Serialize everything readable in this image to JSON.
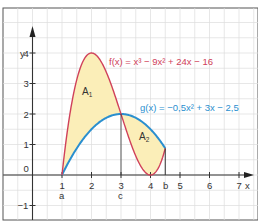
{
  "chart_data": {
    "type": "line",
    "title": "",
    "xlabel": "x",
    "ylabel": "y",
    "xlim": [
      -1,
      7.4
    ],
    "ylim": [
      -1.45,
      4.5
    ],
    "grid": true,
    "grid_step": 0.5,
    "x_ticks": [
      1,
      2,
      3,
      4,
      5,
      6,
      7
    ],
    "x_tick_labels": [
      "1",
      "2",
      "3",
      "4",
      "5",
      "6",
      "7"
    ],
    "y_ticks": [
      -1,
      0,
      1,
      2,
      3,
      4
    ],
    "y_tick_labels": [
      "-1",
      "0",
      "1",
      "2",
      "3",
      "4"
    ],
    "series": [
      {
        "name": "f(x) = x³ − 9x² + 24x − 16",
        "label": "f(x) = x³ − 9x² + 24x − 16",
        "coefficients": [
          1,
          -9,
          24,
          -16
        ],
        "domain": [
          1,
          4.5
        ],
        "color": "#d0415a"
      },
      {
        "name": "g(x) = −0,5x² + 3x − 2,5",
        "label": "g(x) = −0,5x² + 3x − 2,5",
        "coefficients": [
          -0.5,
          3,
          -2.5
        ],
        "domain": [
          1,
          4.5
        ],
        "color": "#2a8fcf"
      }
    ],
    "special_points": [
      {
        "name": "a",
        "x": 1,
        "y": 0
      },
      {
        "name": "c",
        "x": 3,
        "y": 2
      },
      {
        "name": "b",
        "x": 4.5,
        "y": 0.875
      }
    ],
    "shaded_areas": [
      {
        "name": "A1",
        "from": 1,
        "to": 3,
        "color": "#fbeeb8"
      },
      {
        "name": "A2",
        "from": 3,
        "to": 4.5,
        "color": "#fbeeb8"
      }
    ]
  },
  "labels": {
    "x_axis": "x",
    "y_axis": "y",
    "point_a": "a",
    "point_b": "b",
    "point_c": "c",
    "area_1": "A",
    "area_1_sub": "1",
    "area_2": "A",
    "area_2_sub": "2",
    "f_label": "f(x) = x³ − 9x² + 24x − 16",
    "g_label": "g(x) = −0,5x² + 3x − 2,5"
  }
}
